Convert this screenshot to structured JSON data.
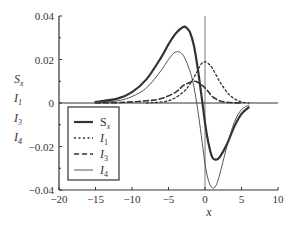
{
  "chart_data": {
    "type": "line",
    "title": "",
    "xlabel": "x",
    "ylabel_stack": [
      "S_x",
      "I_1",
      "I_3",
      "I_4"
    ],
    "xlim": [
      -20,
      10
    ],
    "ylim": [
      -0.04,
      0.04
    ],
    "x_ticks": [
      -20,
      -15,
      -10,
      -5,
      0,
      5,
      10
    ],
    "x_tick_labels": [
      "−20",
      "−15",
      "−10",
      "−5",
      "0",
      "5",
      "10"
    ],
    "y_ticks": [
      0.04,
      0.02,
      0,
      -0.02,
      -0.04
    ],
    "y_tick_labels": [
      "0.04",
      "0.02",
      "0",
      "−0.02",
      "−0.04"
    ],
    "grid": false,
    "legend_position": "lower-left inside",
    "legend": [
      {
        "label": "S",
        "sub": "x",
        "style": "thick-solid"
      },
      {
        "label": "I",
        "sub": "1",
        "style": "dotted"
      },
      {
        "label": "I",
        "sub": "3",
        "style": "dashed"
      },
      {
        "label": "I",
        "sub": "4",
        "style": "thin-solid"
      }
    ],
    "series": [
      {
        "name": "S_x",
        "style": "thick-solid",
        "x": [
          -15,
          -12,
          -10,
          -8,
          -6,
          -5,
          -4,
          -3,
          -2.5,
          -2,
          -1.5,
          -1,
          -0.5,
          0,
          0.5,
          1,
          1.5,
          2,
          3,
          4,
          5,
          6
        ],
        "y": [
          0.0005,
          0.002,
          0.005,
          0.011,
          0.021,
          0.027,
          0.032,
          0.035,
          0.0345,
          0.032,
          0.026,
          0.016,
          0.004,
          -0.009,
          -0.019,
          -0.025,
          -0.026,
          -0.025,
          -0.019,
          -0.011,
          -0.005,
          -0.002
        ]
      },
      {
        "name": "I_1",
        "style": "dotted",
        "x": [
          -8,
          -5,
          -3,
          -2,
          -1,
          -0.5,
          0,
          0.5,
          1,
          2,
          3,
          4,
          5,
          6
        ],
        "y": [
          0,
          0.001,
          0.005,
          0.009,
          0.015,
          0.018,
          0.019,
          0.018,
          0.016,
          0.01,
          0.005,
          0.002,
          0.0005,
          0
        ]
      },
      {
        "name": "I_3",
        "style": "dashed",
        "x": [
          -15,
          -12,
          -10,
          -8,
          -6,
          -4,
          -3,
          -2,
          -1.5,
          -1,
          0,
          0.5,
          1,
          2,
          3,
          4,
          5
        ],
        "y": [
          0,
          0.0002,
          0.0005,
          0.001,
          0.002,
          0.005,
          0.008,
          0.0095,
          0.01,
          0.0095,
          0.007,
          0.005,
          0.003,
          0.001,
          0.0003,
          0.0001,
          0
        ]
      },
      {
        "name": "I_4",
        "style": "thin-solid",
        "x": [
          -15,
          -12,
          -10,
          -8,
          -6,
          -5,
          -4,
          -3,
          -2,
          -1.5,
          -1,
          -0.5,
          0,
          0.5,
          1,
          1.5,
          2,
          3,
          4,
          5,
          6
        ],
        "y": [
          0.0003,
          0.001,
          0.003,
          0.007,
          0.015,
          0.02,
          0.0235,
          0.022,
          0.014,
          0.007,
          -0.003,
          -0.015,
          -0.028,
          -0.036,
          -0.039,
          -0.038,
          -0.033,
          -0.02,
          -0.009,
          -0.003,
          -0.001
        ]
      }
    ]
  }
}
